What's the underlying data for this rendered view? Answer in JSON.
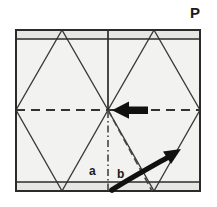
{
  "figure": {
    "kind": "paper-folding-instruction",
    "canvas": {
      "width": 217,
      "height": 207
    },
    "background_color": "#ffffff",
    "paper_fill_color": "#f2f2f0",
    "band_fill_color": "#e4e4e2",
    "line_color": "#3a3a3a",
    "arrow_color": "#111111",
    "label_color": "#1a1a1a"
  },
  "labels": {
    "corner_label": "P",
    "point_a": "a",
    "point_b": "b"
  },
  "sheet": {
    "left": 16,
    "top": 30,
    "right": 200,
    "bottom": 191,
    "top_crease_y": 39,
    "bottom_crease_y": 182,
    "center_x": 108,
    "center_y": 110
  },
  "creases": {
    "solid_vertical_center": {
      "x": 108,
      "y1": 30,
      "y2": 110
    },
    "dashed_horizontal_center": {
      "y": 110,
      "x1": 16,
      "x2": 200
    },
    "dashdot_vertical_lower": {
      "x": 108,
      "y1": 110,
      "y2": 191
    },
    "dashed_diagonal": {
      "x1": 108,
      "y1": 110,
      "x2": 152,
      "y2": 191
    }
  },
  "diamonds": [
    {
      "name": "left-diamond",
      "top": [
        62,
        30
      ],
      "right": [
        108,
        110
      ],
      "bottom": [
        62,
        191
      ],
      "left": [
        16,
        110
      ]
    },
    {
      "name": "right-diamond",
      "top": [
        154,
        30
      ],
      "right": [
        200,
        110
      ],
      "bottom": [
        154,
        191
      ],
      "left": [
        108,
        110
      ]
    }
  ],
  "arrows": {
    "straight": {
      "name": "fold-direction-arrow",
      "direction": "left",
      "tip": [
        112,
        110
      ],
      "tail": [
        148,
        110
      ]
    },
    "curved": {
      "name": "rotate-fold-arrow",
      "direction": "up-right",
      "start": [
        112,
        190
      ],
      "control": [
        140,
        176
      ],
      "end": [
        178,
        152
      ]
    }
  },
  "icons": {
    "straight_arrow": "arrow-left-icon",
    "curved_arrow": "curved-arrow-up-right-icon"
  }
}
